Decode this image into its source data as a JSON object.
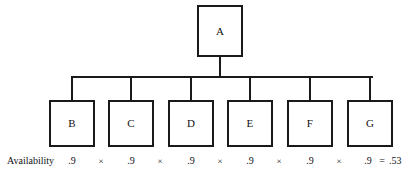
{
  "diagram": {
    "type": "reliability-block-tree",
    "root": {
      "id": "A",
      "label": "A",
      "x": 197,
      "y": 5,
      "w": 46,
      "h": 52
    },
    "children": [
      {
        "id": "B",
        "label": "B",
        "x": 49,
        "y": 100,
        "w": 46,
        "h": 47,
        "center": 72
      },
      {
        "id": "C",
        "label": "C",
        "x": 108,
        "y": 100,
        "w": 46,
        "h": 47,
        "center": 131
      },
      {
        "id": "D",
        "label": "D",
        "x": 168,
        "y": 100,
        "w": 46,
        "h": 47,
        "center": 191
      },
      {
        "id": "E",
        "label": "E",
        "x": 227,
        "y": 100,
        "w": 46,
        "h": 47,
        "center": 250
      },
      {
        "id": "F",
        "label": "F",
        "x": 287,
        "y": 100,
        "w": 46,
        "h": 47,
        "center": 310
      },
      {
        "id": "G",
        "label": "G",
        "x": 347,
        "y": 100,
        "w": 46,
        "h": 47,
        "center": 370
      }
    ]
  },
  "availability": {
    "label": "Availability",
    "label_x": 7,
    "operator": "×",
    "equals": "=",
    "result": ".53",
    "result_x": 389,
    "equals_x": 376,
    "terms": [
      {
        "value": ".9",
        "x": 62
      },
      {
        "value": ".9",
        "x": 121
      },
      {
        "value": ".9",
        "x": 181
      },
      {
        "value": ".9",
        "x": 240
      },
      {
        "value": ".9",
        "x": 300
      },
      {
        "value": ".9",
        "x": 358
      }
    ],
    "operators": [
      {
        "x": 94
      },
      {
        "x": 153
      },
      {
        "x": 213
      },
      {
        "x": 272
      },
      {
        "x": 332
      }
    ]
  },
  "style": {
    "line_color": "#1a1a1a",
    "background": "#ffffff",
    "text_color": "#111111"
  }
}
